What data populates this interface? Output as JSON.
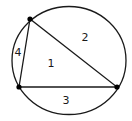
{
  "diagram": {
    "colors": {
      "stroke": "#1a1a1a",
      "background": "#ffffff"
    },
    "circle": {
      "cx": 69,
      "cy": 60.5,
      "rx": 57,
      "ry": 54
    },
    "vertices": [
      {
        "name": "top",
        "x": 30,
        "y": 19
      },
      {
        "name": "bottom-left",
        "x": 19,
        "y": 87
      },
      {
        "name": "right",
        "x": 117,
        "y": 87
      }
    ],
    "regions": [
      {
        "label": "1",
        "x": 51,
        "y": 67
      },
      {
        "label": "2",
        "x": 85,
        "y": 41
      },
      {
        "label": "3",
        "x": 66,
        "y": 104
      },
      {
        "label": "4",
        "x": 18,
        "y": 56
      }
    ]
  }
}
